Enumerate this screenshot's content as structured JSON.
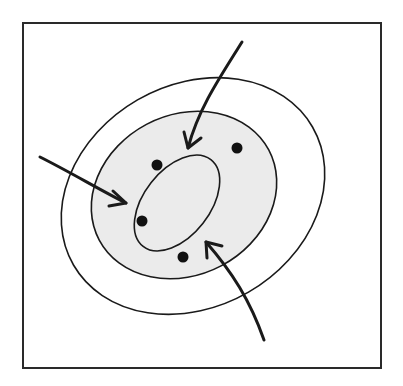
{
  "diagram": {
    "type": "contour-ellipses",
    "colors": {
      "background": "#ffffff",
      "frame": "#2a2a2a",
      "stroke": "#1a1a1a",
      "shaded_fill": "#ebebeb",
      "points": "#111111",
      "arrows": "#1a1a1a"
    },
    "frame": {
      "x": 23,
      "y": 23,
      "width": 358,
      "height": 345
    },
    "ellipses": [
      {
        "name": "outer",
        "cx": 193,
        "cy": 196,
        "rx": 138,
        "ry": 111,
        "rotate": -30,
        "filled": false
      },
      {
        "name": "middle",
        "cx": 184,
        "cy": 195,
        "rx": 96,
        "ry": 80,
        "rotate": -28,
        "filled": true
      },
      {
        "name": "inner",
        "cx": 177,
        "cy": 203,
        "rx": 55,
        "ry": 33,
        "rotate": -52,
        "filled": true
      }
    ],
    "points": [
      {
        "x": 157,
        "y": 165
      },
      {
        "x": 237,
        "y": 148
      },
      {
        "x": 142,
        "y": 221
      },
      {
        "x": 183,
        "y": 257
      }
    ],
    "arrows": [
      {
        "name": "arrow-top",
        "path": "M 242 42 C 218 80, 198 110, 188 148",
        "head": [
          188,
          148
        ],
        "dir": "down"
      },
      {
        "name": "arrow-left",
        "path": "M 40 157 C 70 172, 100 190, 126 203",
        "head": [
          126,
          203
        ],
        "dir": "right"
      },
      {
        "name": "arrow-bottom-right",
        "path": "M 264 340 C 250 300, 232 272, 206 242",
        "head": [
          206,
          242
        ],
        "dir": "up-left"
      }
    ]
  }
}
